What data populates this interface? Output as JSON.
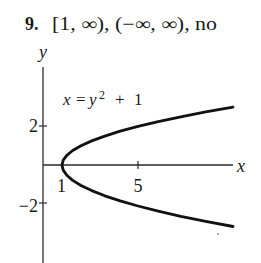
{
  "header": {
    "number": "9.",
    "answer": "[1, ∞), (−∞, ∞), no"
  },
  "graph": {
    "equation": {
      "lhs": "x",
      "eq": "=",
      "base": "y",
      "exp": "2",
      "plus": "+",
      "const": "1"
    },
    "axis_labels": {
      "x": "x",
      "y": "y"
    },
    "x_ticks": [
      {
        "value": 1,
        "label": "1"
      },
      {
        "value": 5,
        "label": "5"
      }
    ],
    "y_ticks": [
      {
        "value": 2,
        "label": "2"
      },
      {
        "value": -2,
        "label": "−2"
      }
    ]
  },
  "chart_data": {
    "type": "line",
    "xlabel": "x",
    "ylabel": "y",
    "xlim": [
      0,
      10
    ],
    "ylim": [
      -3,
      3
    ],
    "x_tick_labels": [
      "1",
      "5"
    ],
    "y_tick_labels": [
      "2",
      "−2"
    ],
    "grid": false,
    "legend": "none",
    "annotations": [
      "x = y² + 1"
    ],
    "series": [
      {
        "name": "x = y^2 + 1",
        "y": [
          -3,
          -2.75,
          -2.5,
          -2.25,
          -2,
          -1.75,
          -1.5,
          -1.25,
          -1,
          -0.75,
          -0.5,
          -0.25,
          0,
          0.25,
          0.5,
          0.75,
          1,
          1.25,
          1.5,
          1.75,
          2,
          2.25,
          2.5,
          2.75,
          3
        ],
        "x": [
          10,
          8.5625,
          7.25,
          6.0625,
          5,
          4.0625,
          3.25,
          2.5625,
          2,
          1.5625,
          1.25,
          1.0625,
          1,
          1.0625,
          1.25,
          1.5625,
          2,
          2.5625,
          3.25,
          4.0625,
          5,
          6.0625,
          7.25,
          8.5625,
          10
        ]
      }
    ],
    "answer": {
      "domain": "[1, ∞)",
      "range": "(−∞, ∞)",
      "is_function": "no"
    }
  }
}
